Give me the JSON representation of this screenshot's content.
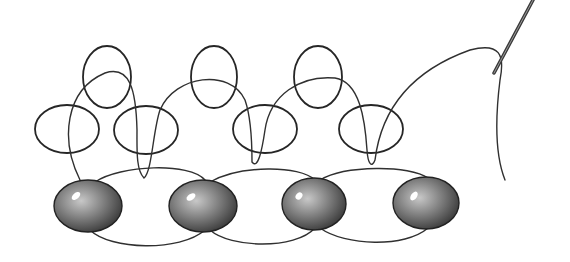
{
  "illustration": {
    "subject": "Beadwork stitch diagram: pencil sketch of beads joined by thread loops with needle",
    "colors": {
      "background": "#ffffff",
      "line": "#2a2a2a",
      "bead_dark": "#3a3a3a",
      "bead_mid": "#7a7a7a",
      "bead_light": "#c8c8c8"
    },
    "beads": [
      {
        "cx": 88,
        "cy": 206,
        "rx": 34,
        "ry": 26
      },
      {
        "cx": 203,
        "cy": 206,
        "rx": 34,
        "ry": 26
      },
      {
        "cx": 314,
        "cy": 204,
        "rx": 32,
        "ry": 26
      },
      {
        "cx": 426,
        "cy": 203,
        "rx": 33,
        "ry": 26
      }
    ],
    "top_loops": [
      {
        "cx": 107,
        "cy": 77,
        "rx": 24,
        "ry": 31
      },
      {
        "cx": 214,
        "cy": 77,
        "rx": 23,
        "ry": 31
      },
      {
        "cx": 318,
        "cy": 77,
        "rx": 24,
        "ry": 31
      }
    ],
    "middle_loops": [
      {
        "cx": 67,
        "cy": 129,
        "rx": 32,
        "ry": 24
      },
      {
        "cx": 146,
        "cy": 130,
        "rx": 32,
        "ry": 24
      },
      {
        "cx": 265,
        "cy": 129,
        "rx": 32,
        "ry": 24
      },
      {
        "cx": 371,
        "cy": 129,
        "rx": 32,
        "ry": 24
      }
    ],
    "needle": {
      "x1": 533,
      "y1": 0,
      "x2": 494,
      "y2": 73
    }
  }
}
